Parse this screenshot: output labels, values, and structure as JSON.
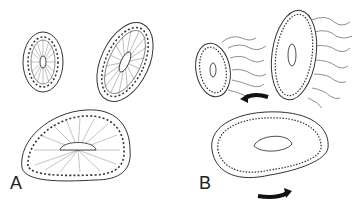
{
  "panels": [
    {
      "label": "A",
      "description": "Cyst cross-sections with cuboidal epithelial lining and radial lumen"
    },
    {
      "label": "B",
      "description": "Cyst cross-sections with elongated cells and protrusions, rotation arrows"
    }
  ]
}
